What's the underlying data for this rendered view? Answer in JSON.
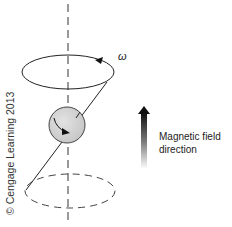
{
  "figure": {
    "omega_label": "ω",
    "magnetic_field_label": {
      "line1": "Magnetic field",
      "line2": "direction"
    },
    "copyright": "© Cengage Learning 2013"
  },
  "colors": {
    "line": "#222222",
    "sphere_fill": "#d4d4d4",
    "sphere_stroke": "#444444",
    "arrow_dark": "#111111",
    "arrow_fade": "#ffffff",
    "dashed_axis": "#333333"
  },
  "elements": {
    "axis": "dashed vertical axis",
    "top_orbit": "solid ellipse with rotation arrow",
    "sphere": "spinning nucleus with curved arrow",
    "bottom_orbit": "dashed ellipse",
    "field_arrow": "upward gradient arrow"
  }
}
